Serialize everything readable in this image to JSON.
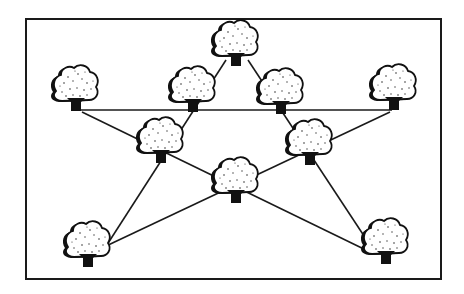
{
  "figure": {
    "title": "Ten trees planted in five rows of four",
    "width": 464,
    "height": 294,
    "colors": {
      "ink": "#111111",
      "background": "#ffffff"
    },
    "frame": {
      "x": 26,
      "y": 19,
      "width": 415,
      "height": 260
    }
  },
  "trees": [
    {
      "id": "top",
      "cx": 236,
      "cy": 42,
      "trunk_y": 62
    },
    {
      "id": "outer-left",
      "cx": 76,
      "cy": 87,
      "trunk_y": 108
    },
    {
      "id": "inner-left",
      "cx": 193,
      "cy": 88,
      "trunk_y": 109
    },
    {
      "id": "inner-right",
      "cx": 281,
      "cy": 90,
      "trunk_y": 110
    },
    {
      "id": "outer-right",
      "cx": 394,
      "cy": 86,
      "trunk_y": 107
    },
    {
      "id": "mid-left",
      "cx": 161,
      "cy": 139,
      "trunk_y": 160
    },
    {
      "id": "mid-right",
      "cx": 310,
      "cy": 141,
      "trunk_y": 162
    },
    {
      "id": "center",
      "cx": 236,
      "cy": 179,
      "trunk_y": 200
    },
    {
      "id": "bottom-left",
      "cx": 88,
      "cy": 243,
      "trunk_y": 264
    },
    {
      "id": "bottom-right",
      "cx": 386,
      "cy": 240,
      "trunk_y": 262
    }
  ],
  "lines": [
    {
      "id": "row-horizontal",
      "trees": [
        "outer-left",
        "inner-left",
        "inner-right",
        "outer-right"
      ],
      "x1": 80,
      "y1": 110,
      "x2": 392,
      "y2": 110
    },
    {
      "id": "row-top-to-bottom-left",
      "trees": [
        "top",
        "inner-left",
        "mid-left",
        "bottom-left"
      ],
      "x1": 226,
      "y1": 60,
      "x2": 103,
      "y2": 251
    },
    {
      "id": "row-top-to-bottom-right",
      "trees": [
        "top",
        "inner-right",
        "mid-right",
        "bottom-right"
      ],
      "x1": 248,
      "y1": 60,
      "x2": 372,
      "y2": 248
    },
    {
      "id": "row-left-to-bottom-right",
      "trees": [
        "outer-left",
        "mid-left",
        "center",
        "bottom-right"
      ],
      "x1": 82,
      "y1": 112,
      "x2": 370,
      "y2": 252
    },
    {
      "id": "row-right-to-bottom-left",
      "trees": [
        "outer-right",
        "mid-right",
        "center",
        "bottom-left"
      ],
      "x1": 390,
      "y1": 112,
      "x2": 104,
      "y2": 247
    }
  ]
}
